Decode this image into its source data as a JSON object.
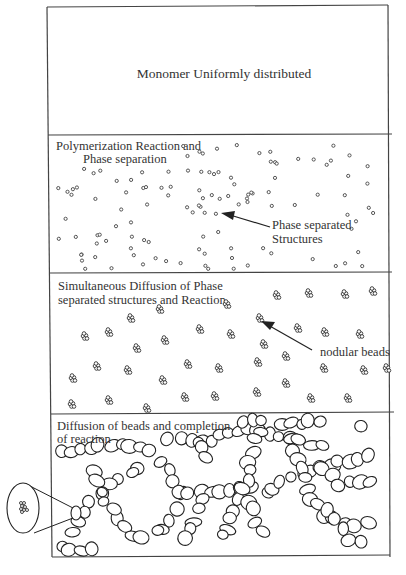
{
  "diagram": {
    "panels": [
      {
        "id": "stage-1",
        "label_lines": [
          "Monomer Uniformly distributed"
        ]
      },
      {
        "id": "stage-2",
        "label_lines": [
          "Polymerization Reaction and",
          "Phase separation"
        ],
        "annotation_lines": [
          "Phase separated",
          "Structures"
        ]
      },
      {
        "id": "stage-3",
        "label_lines": [
          "Simultaneous Diffusion of Phase",
          "separated structures and Reaction"
        ],
        "annotation_lines": [
          "nodular beads"
        ]
      },
      {
        "id": "stage-4",
        "label_lines": [
          "Diffusion of beads and completion",
          "of reaction"
        ]
      }
    ],
    "magnifier": {
      "depicts": "cluster of nodular beads inside a bead"
    },
    "colors": {
      "line": "#444444",
      "text": "#333333",
      "background": "#ffffff"
    }
  }
}
